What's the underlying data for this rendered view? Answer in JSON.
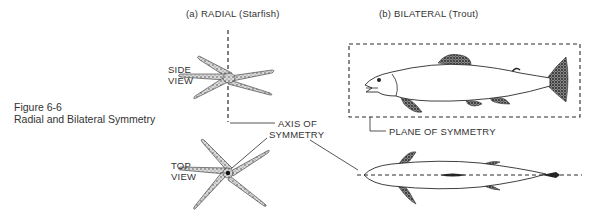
{
  "figure": {
    "number": "Figure 6-6",
    "title": "Radial and Bilateral Symmetry"
  },
  "panels": {
    "radial": {
      "heading": "(a)  RADIAL (Starfish)",
      "side_view_label": [
        "SIDE",
        "VIEW"
      ],
      "top_view_label": [
        "TOP",
        "VIEW"
      ],
      "organism": "starfish"
    },
    "bilateral": {
      "heading": "(b)  BILATERAL (Trout)",
      "plane_label": "PLANE OF  SYMMETRY",
      "organism": "trout"
    }
  },
  "annotations": {
    "axis_label": [
      "AXIS OF",
      "SYMMETRY"
    ]
  },
  "colors": {
    "ink": "#2a2a2a",
    "background": "#ffffff"
  }
}
